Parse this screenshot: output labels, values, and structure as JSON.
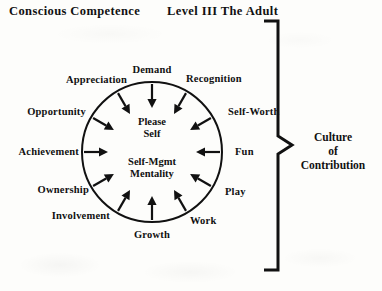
{
  "header": {
    "left": "Conscious Competence",
    "right": "Level III  The Adult"
  },
  "center": {
    "line1": "Please",
    "line2": "Self",
    "line3": "Self-Mgmt",
    "line4": "Mentality"
  },
  "brace": {
    "label_line1": "Culture",
    "label_line2": "of",
    "label_line3": "Contribution"
  },
  "wheel": {
    "center_x": 152,
    "center_y": 152,
    "radius": 70,
    "stroke_color": "#111111",
    "arrow_count": 12,
    "labels": [
      {
        "id": "demand",
        "text": "Demand",
        "angle_deg": 90,
        "align": "c",
        "x": 152,
        "y": 70
      },
      {
        "id": "recognition",
        "text": "Recognition",
        "angle_deg": 60,
        "align": "l",
        "x": 186,
        "y": 79
      },
      {
        "id": "self-worth",
        "text": "Self-Worth",
        "angle_deg": 30,
        "align": "l",
        "x": 228,
        "y": 112
      },
      {
        "id": "fun",
        "text": "Fun",
        "angle_deg": 0,
        "align": "l",
        "x": 235,
        "y": 152
      },
      {
        "id": "play",
        "text": "Play",
        "angle_deg": -30,
        "align": "l",
        "x": 225,
        "y": 192
      },
      {
        "id": "work",
        "text": "Work",
        "angle_deg": -60,
        "align": "l",
        "x": 190,
        "y": 221
      },
      {
        "id": "growth",
        "text": "Growth",
        "angle_deg": -90,
        "align": "c",
        "x": 152,
        "y": 235
      },
      {
        "id": "involvement",
        "text": "Involvement",
        "angle_deg": -120,
        "align": "r",
        "x": 110,
        "y": 216
      },
      {
        "id": "ownership",
        "text": "Ownership",
        "angle_deg": -150,
        "align": "r",
        "x": 89,
        "y": 190
      },
      {
        "id": "achievement",
        "text": "Achievement",
        "angle_deg": 180,
        "align": "r",
        "x": 79,
        "y": 152
      },
      {
        "id": "opportunity",
        "text": "Opportunity",
        "angle_deg": 150,
        "align": "r",
        "x": 86,
        "y": 112
      },
      {
        "id": "appreciation",
        "text": "Appreciation",
        "angle_deg": 120,
        "align": "r",
        "x": 127,
        "y": 80
      }
    ]
  }
}
